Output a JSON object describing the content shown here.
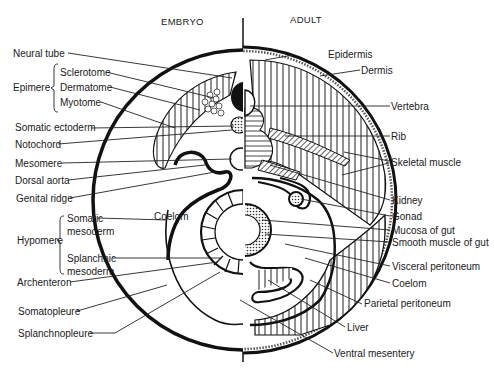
{
  "diagram": {
    "headers": {
      "left": "EMBRYO",
      "right": "ADULT"
    },
    "left_labels": {
      "neural_tube": "Neural tube",
      "epimere": "Epimere",
      "sclerotome": "Sclerotome",
      "dermatome": "Dermatome",
      "myotome": "Myotome",
      "somatic_ectoderm": "Somatic ectoderm",
      "notochord": "Notochord",
      "mesomere": "Mesomere",
      "dorsal_aorta": "Dorsal aorta",
      "genital_ridge": "Genital ridge",
      "hypomere": "Hypomere",
      "somatic_mesoderm_1": "Somatic",
      "somatic_mesoderm_2": "mesoderm",
      "splanchnic_mesoderm_1": "Splanchnic",
      "splanchnic_mesoderm_2": "mesoderm",
      "archenteron": "Archenteron",
      "somatopleure": "Somatopleure",
      "splanchnopleure": "Splanchnopleure",
      "coelom_embryo": "Coelom"
    },
    "right_labels": {
      "epidermis": "Epidermis",
      "dermis": "Dermis",
      "vertebra": "Vertebra",
      "rib": "Rib",
      "skeletal_muscle": "Skeletal muscle",
      "kidney": "Kidney",
      "gonad": "Gonad",
      "mucosa_of_gut": "Mucosa of gut",
      "smooth_muscle_of_gut": "Smooth muscle of gut",
      "visceral_peritoneum": "Visceral peritoneum",
      "coelom": "Coelom",
      "parietal_peritoneum": "Parietal peritoneum",
      "liver": "Liver",
      "ventral_mesentery": "Ventral mesentery"
    }
  }
}
